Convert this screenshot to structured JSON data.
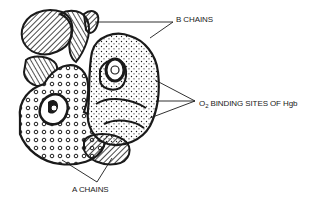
{
  "diagram": {
    "labels": {
      "b_chains": "B CHAINS",
      "o2_prefix": "O",
      "o2_subscript": "2",
      "o2_rest": " BINDING SITES OF Hgb",
      "a_chains": "A CHAINS"
    },
    "colors": {
      "ink": "#1a1a1a",
      "background": "#ffffff"
    }
  }
}
